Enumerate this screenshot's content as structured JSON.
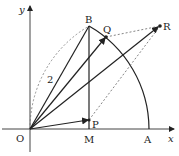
{
  "figure": {
    "axes": {
      "x_label": "x",
      "y_label": "y"
    },
    "points": {
      "O": {
        "label": "O",
        "x": 30,
        "y": 129
      },
      "A": {
        "label": "A",
        "x": 149,
        "y": 129
      },
      "B": {
        "label": "B",
        "x": 89,
        "y": 26
      },
      "M": {
        "label": "M",
        "x": 89,
        "y": 129
      },
      "P": {
        "label": "P",
        "x": 89,
        "y": 120
      },
      "Q": {
        "label": "Q",
        "x": 106,
        "y": 37
      },
      "R": {
        "label": "R",
        "x": 160,
        "y": 26
      }
    },
    "length_label": "2",
    "colors": {
      "line": "#222222",
      "dashed": "#666666",
      "background": "#ffffff"
    }
  }
}
